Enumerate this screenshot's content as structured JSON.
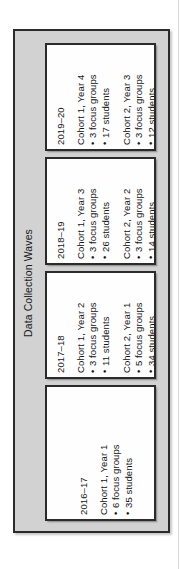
{
  "figure": {
    "title": "Data Collection Waves",
    "orientation": "rotated-90-ccw",
    "waves": [
      {
        "year": "2019–20",
        "cohorts": [
          {
            "label": "Cohort 1, Year 4",
            "bullets": [
              "3 focus groups",
              "17 students"
            ]
          },
          {
            "label": "Cohort 2, Year 3",
            "bullets": [
              "3 focus groups",
              "12 students"
            ]
          }
        ]
      },
      {
        "year": "2018–19",
        "cohorts": [
          {
            "label": "Cohort 1, Year 3",
            "bullets": [
              "3 focus groups",
              "26 students"
            ]
          },
          {
            "label": "Cohort 2, Year 2",
            "bullets": [
              "3 focus groups",
              "14 students"
            ]
          }
        ]
      },
      {
        "year": "2017–18",
        "cohorts": [
          {
            "label": "Cohort 1, Year 2",
            "bullets": [
              "3 focus groups",
              "11 students"
            ]
          },
          {
            "label": "Cohort 2, Year 1",
            "bullets": [
              "5 focus groups",
              "34 students"
            ]
          }
        ]
      },
      {
        "year": "2016–17",
        "cohorts": [
          {
            "label": "Cohort 1, Year 1",
            "bullets": [
              "6 focus groups",
              "35 students"
            ]
          }
        ]
      }
    ]
  },
  "colors": {
    "frame_fill": "#d2d2d2",
    "frame_border": "#2b2b2b",
    "box_fill": "#fefefe",
    "box_border": "#2b2b2b",
    "text": "#141414",
    "page_background": "#ffffff"
  }
}
